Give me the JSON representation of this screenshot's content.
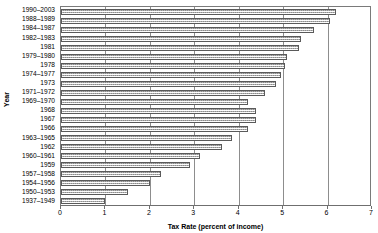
{
  "chart_data": {
    "type": "bar",
    "orientation": "horizontal",
    "title": "",
    "xlabel": "Tax Rate (percent of income)",
    "ylabel": "Year",
    "xlim": [
      0,
      7
    ],
    "ylim": null,
    "grid": true,
    "legend": null,
    "x_ticks": [
      "0",
      "1",
      "2",
      "3",
      "4",
      "5",
      "6",
      "7"
    ],
    "categories": [
      "1990–2003",
      "1988–1989",
      "1984–1987",
      "1982–1983",
      "1981",
      "1979–1980",
      "1978",
      "1974–1977",
      "1973",
      "1971–1972",
      "1969–1970",
      "1968",
      "1967",
      "1966",
      "1963–1965",
      "1962",
      "1960–1961",
      "1959",
      "1957–1958",
      "1954–1956",
      "1950–1953",
      "1937–1949"
    ],
    "values": [
      6.2,
      6.06,
      5.7,
      5.4,
      5.35,
      5.08,
      5.05,
      4.95,
      4.85,
      4.6,
      4.2,
      4.4,
      4.4,
      4.2,
      3.85,
      3.625,
      3.125,
      2.9,
      2.25,
      2.0,
      1.5,
      1.0
    ],
    "bar_style": {
      "fill": "#d9d9d9",
      "pattern": "stippled",
      "border": "#5a5a5a"
    },
    "axis_color": "#7a7a7a",
    "grid_color": "#8d8d8d",
    "background": "#ffffff"
  }
}
